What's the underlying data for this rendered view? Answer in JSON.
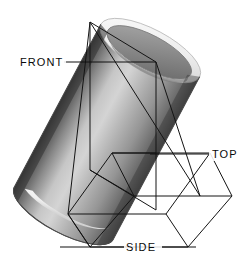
{
  "figure": {
    "background_color": "#ffffff",
    "width": 244,
    "height": 258,
    "object": {
      "name": "hollow-cylinder",
      "description": "Shaded grey cylindrical tube, open at both ends, tilted diagonally from upper-left to lower-right",
      "shading": {
        "body_dark_edge": "#3f3f3f",
        "body_highlight": "#d2d2d2",
        "body_mid": "#8e8e8e",
        "body_right_dark": "#5a5a5a",
        "rim_highlight": "#f2f2f2",
        "bore_dark": "#6d6d6d",
        "bottom_highlight": "#ffffff"
      }
    },
    "wireframe": {
      "name": "projection-box",
      "stroke_color": "#141414",
      "stroke_width": 1
    }
  },
  "labels": {
    "front": {
      "text": "FRONT",
      "x": 20,
      "y": 66,
      "leader_from_x": 64,
      "leader_to_x": 156,
      "leader_y": 62
    },
    "top": {
      "text": "TOP",
      "x": 212,
      "y": 158,
      "leader_from_x": 150,
      "leader_to_x": 209,
      "leader_y": 154
    },
    "side": {
      "text": "SIDE",
      "x": 126,
      "y": 251,
      "leader_from_x": 120,
      "leader_to_x": 126,
      "leader_y": 247
    }
  },
  "colors": {
    "line": "#141414",
    "text": "#0a0a0a",
    "background": "#ffffff"
  }
}
